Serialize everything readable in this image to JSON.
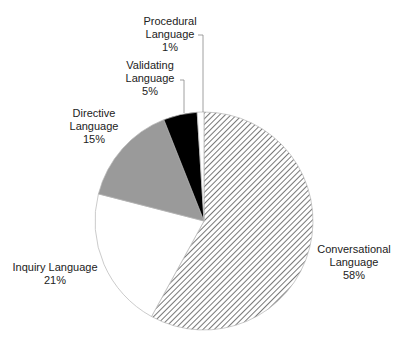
{
  "chart_data": {
    "type": "pie",
    "title": "",
    "start_angle_deg": 0,
    "direction": "clockwise",
    "categories": [
      "Conversational Language",
      "Inquiry Language",
      "Directive Language",
      "Validating Language",
      "Procedural Language"
    ],
    "values": [
      58,
      21,
      15,
      5,
      1
    ],
    "unit": "%",
    "slices": [
      {
        "name": "Conversational Language",
        "value": 58,
        "fill": "hatch",
        "color": "#555555"
      },
      {
        "name": "Inquiry Language",
        "value": 21,
        "fill": "solid",
        "color": "#ffffff"
      },
      {
        "name": "Directive Language",
        "value": 15,
        "fill": "solid",
        "color": "#9a9a9a"
      },
      {
        "name": "Validating Language",
        "value": 5,
        "fill": "solid",
        "color": "#000000"
      },
      {
        "name": "Procedural Language",
        "value": 1,
        "fill": "solid",
        "color": "#ffffff"
      }
    ],
    "legend": "none (data labels)"
  },
  "labels": {
    "conversational": {
      "line1": "Conversational",
      "line2": "Language",
      "pct": "58%"
    },
    "inquiry": {
      "line1": "Inquiry Language",
      "pct": "21%"
    },
    "directive": {
      "line1": "Directive",
      "line2": "Language",
      "pct": "15%"
    },
    "validating": {
      "line1": "Validating",
      "line2": "Language",
      "pct": "5%"
    },
    "procedural": {
      "line1": "Procedural",
      "line2": "Language",
      "pct": "1%"
    }
  }
}
